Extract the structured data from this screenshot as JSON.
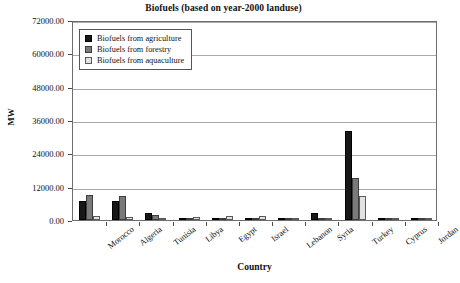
{
  "chart_data": {
    "type": "bar",
    "title": "Biofuels (based on year-2000 landuse)",
    "xlabel": "Country",
    "ylabel": "MW",
    "ylim": [
      0,
      72000
    ],
    "ytick_labels": [
      "0.00",
      "12000.00",
      "24000.00",
      "36000.00",
      "48000.00",
      "60000.00",
      "72000.00"
    ],
    "ytick_values": [
      0,
      12000,
      24000,
      36000,
      48000,
      60000,
      72000
    ],
    "grid": true,
    "legend_position": "upper-left-inside",
    "categories": [
      "Morocco",
      "Algeria",
      "Tunisia",
      "Libya",
      "Egypt",
      "Israel",
      "Lebanon",
      "Syria",
      "Turkey",
      "Cyprus",
      "Jordan"
    ],
    "series": [
      {
        "name": "Biofuels from agriculture",
        "color": "#171717",
        "values": [
          6800,
          6900,
          2600,
          900,
          700,
          500,
          500,
          2700,
          32000,
          250,
          200
        ]
      },
      {
        "name": "Biofuels from forestry",
        "color": "#7a7a7a",
        "values": [
          8900,
          8800,
          1800,
          400,
          300,
          250,
          200,
          700,
          15000,
          300,
          150
        ]
      },
      {
        "name": "Biofuels from aquaculture",
        "color": "#e2e2e2",
        "values": [
          1300,
          1200,
          450,
          1100,
          1400,
          1300,
          400,
          300,
          8500,
          500,
          600
        ]
      }
    ]
  },
  "legend": {
    "items": [
      {
        "label": "Biofuels from agriculture",
        "swatch": "agriculture"
      },
      {
        "label": "Biofuels from forestry",
        "swatch": "forestry"
      },
      {
        "label": "Biofuels from aquaculture",
        "swatch": "aquaculture"
      }
    ]
  }
}
